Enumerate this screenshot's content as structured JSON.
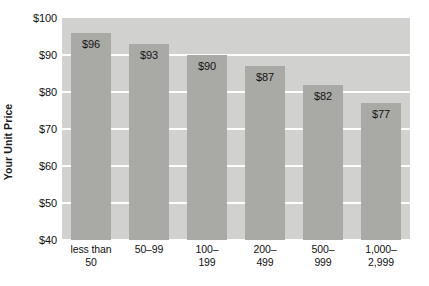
{
  "chart_data": {
    "type": "bar",
    "title": "",
    "subtitle": "",
    "xlabel": "",
    "ylabel": "Your Unit Price",
    "ylim": [
      40,
      100
    ],
    "yticks": [
      "$40",
      "$50",
      "$60",
      "$70",
      "$80",
      "$90",
      "$100"
    ],
    "ytick_values": [
      40,
      50,
      60,
      70,
      80,
      90,
      100
    ],
    "grid": true,
    "legend": null,
    "legend_position": "none",
    "categories": [
      "less than 50",
      "50–99",
      "100–199",
      "200–499",
      "500–999",
      "1,000–2,999"
    ],
    "category_lines": [
      [
        "less than",
        "50"
      ],
      [
        "50–99",
        ""
      ],
      [
        "100–",
        "199"
      ],
      [
        "200–",
        "499"
      ],
      [
        "500–",
        "999"
      ],
      [
        "1,000–",
        "2,999"
      ]
    ],
    "values": [
      96,
      93,
      90,
      87,
      82,
      77
    ],
    "data_labels": [
      "$96",
      "$93",
      "$90",
      "$87",
      "$82",
      "$77"
    ],
    "colors": {
      "plot_background": "#d1d1cf",
      "bar": "#a9a9a6",
      "gridline": "#fdfdfc",
      "text": "#111111",
      "page_background": "#ffffff"
    }
  }
}
